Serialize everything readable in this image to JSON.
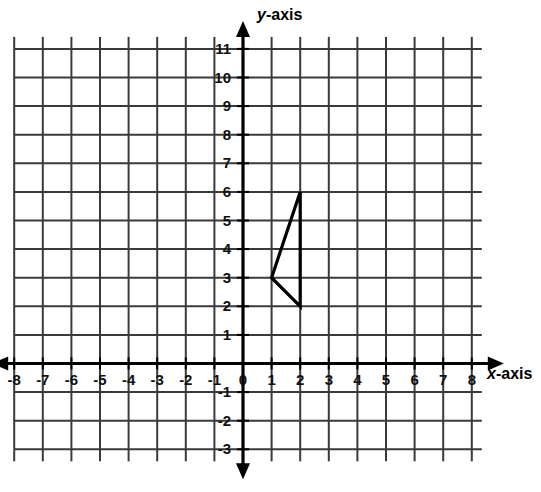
{
  "chart_data": {
    "type": "scatter",
    "title": "",
    "subtitle": "",
    "xlabel": "x-axis",
    "ylabel": "y-axis",
    "xlabel_var": "x",
    "xlabel_rest": "-axis",
    "ylabel_var": "y",
    "ylabel_rest": "-axis",
    "xlim": [
      -8,
      8
    ],
    "ylim": [
      -3,
      11
    ],
    "x_ticks": [
      -8,
      -7,
      -6,
      -5,
      -4,
      -3,
      -2,
      -1,
      0,
      1,
      2,
      3,
      4,
      5,
      6,
      7,
      8
    ],
    "y_ticks": [
      -3,
      -2,
      -1,
      1,
      2,
      3,
      4,
      5,
      6,
      7,
      8,
      9,
      10,
      11
    ],
    "x_tick_labels": [
      "-8",
      "-7",
      "-6",
      "-5",
      "-4",
      "-3",
      "-2",
      "-1",
      "0",
      "1",
      "2",
      "3",
      "4",
      "5",
      "6",
      "7",
      "8"
    ],
    "y_tick_labels": [
      "-3",
      "-2",
      "-1",
      "1",
      "2",
      "3",
      "4",
      "5",
      "6",
      "7",
      "8",
      "9",
      "10",
      "11"
    ],
    "origin_label": "0",
    "grid": true,
    "grid_color": "#3a3a3a",
    "axis_color": "#000000",
    "shape_color": "#000000",
    "background": "#ffffff",
    "legend": "none",
    "annotations": [],
    "shapes": [
      {
        "name": "triangle",
        "closed": true,
        "points": [
          {
            "x": 1,
            "y": 3
          },
          {
            "x": 2,
            "y": 6
          },
          {
            "x": 2,
            "y": 2
          }
        ]
      }
    ]
  }
}
